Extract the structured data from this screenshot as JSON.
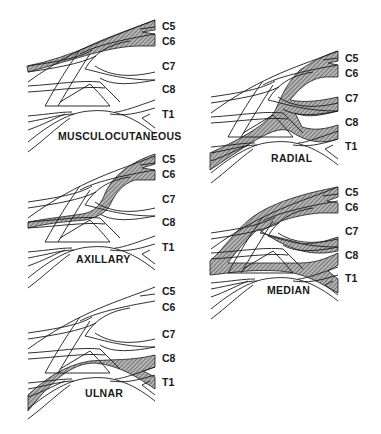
{
  "figure": {
    "type": "brachial plexus nerve root contribution diagram",
    "colors": {
      "line": "#1a1a1a",
      "hatch_fill": "#8a8a8a",
      "background": "#ffffff"
    },
    "panels": [
      {
        "id": "musculocutaneous",
        "label": "MUSCULOCUTANEOUS",
        "roots": [
          "C5",
          "C6",
          "C7",
          "C8",
          "T1"
        ],
        "highlighted_roots": [
          "C5",
          "C6"
        ]
      },
      {
        "id": "radial",
        "label": "RADIAL",
        "roots": [
          "C5",
          "C6",
          "C7",
          "C8",
          "T1"
        ],
        "highlighted_roots": [
          "C5",
          "C6",
          "C7",
          "C8"
        ]
      },
      {
        "id": "axillary",
        "label": "AXILLARY",
        "roots": [
          "C5",
          "C6",
          "C7",
          "C8",
          "T1"
        ],
        "highlighted_roots": [
          "C5",
          "C6"
        ]
      },
      {
        "id": "median",
        "label": "MEDIAN",
        "roots": [
          "C5",
          "C6",
          "C7",
          "C8",
          "T1"
        ],
        "highlighted_roots": [
          "C5",
          "C6",
          "C7",
          "C8",
          "T1"
        ]
      },
      {
        "id": "ulnar",
        "label": "ULNAR",
        "roots": [
          "C5",
          "C6",
          "C7",
          "C8",
          "T1"
        ],
        "highlighted_roots": [
          "C8",
          "T1"
        ]
      }
    ]
  }
}
